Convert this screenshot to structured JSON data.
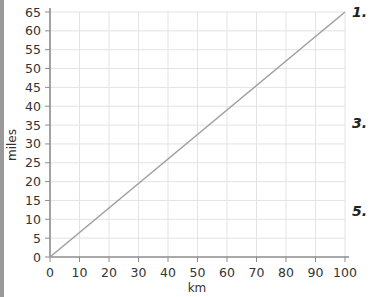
{
  "chart_data": {
    "type": "line",
    "title": "",
    "xlabel": "km",
    "ylabel": "miles",
    "xlim": [
      0,
      100
    ],
    "ylim": [
      0,
      65
    ],
    "x_ticks": [
      0,
      10,
      20,
      30,
      40,
      50,
      60,
      70,
      80,
      90,
      100
    ],
    "y_ticks": [
      0,
      5,
      10,
      15,
      20,
      25,
      30,
      35,
      40,
      45,
      50,
      55,
      60,
      65
    ],
    "grid": true,
    "legend": null,
    "series": [
      {
        "name": "km to miles",
        "x": [
          0,
          100
        ],
        "y": [
          0,
          65
        ],
        "color": "#a0a0a0"
      }
    ]
  },
  "side_labels": [
    "1.",
    "3.",
    "5."
  ],
  "colors": {
    "grid": "#e3e3e3",
    "axis": "#8c8c8c",
    "line": "#a0a0a0",
    "left_bar": "#9a9a9a"
  }
}
